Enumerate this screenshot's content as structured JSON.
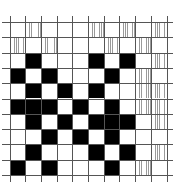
{
  "diagram": {
    "title": "",
    "type": "weave-draft-grid",
    "rows": 10,
    "cols": 10,
    "legend": {
      "B": "black filled cell",
      "H": "vertical-hatched cell",
      "W": "empty white cell"
    },
    "colors": {
      "filled": "#000000",
      "hatch": "#9a9a9a",
      "background": "#ffffff",
      "grid": "#555555"
    },
    "grid": [
      [
        "W",
        "H",
        "W",
        "W",
        "W",
        "H",
        "W",
        "H",
        "W",
        "H"
      ],
      [
        "H",
        "W",
        "H",
        "W",
        "W",
        "W",
        "H",
        "W",
        "H",
        "W"
      ],
      [
        "W",
        "B",
        "W",
        "W",
        "W",
        "B",
        "W",
        "B",
        "W",
        "H"
      ],
      [
        "B",
        "W",
        "B",
        "W",
        "W",
        "W",
        "B",
        "W",
        "H",
        "W"
      ],
      [
        "W",
        "B",
        "W",
        "B",
        "W",
        "B",
        "W",
        "W",
        "H",
        "H"
      ],
      [
        "B",
        "B",
        "B",
        "W",
        "B",
        "W",
        "B",
        "W",
        "H",
        "H"
      ],
      [
        "W",
        "B",
        "W",
        "B",
        "W",
        "B",
        "B",
        "B",
        "W",
        "H"
      ],
      [
        "W",
        "W",
        "B",
        "W",
        "B",
        "W",
        "B",
        "W",
        "W",
        "W"
      ],
      [
        "W",
        "B",
        "W",
        "W",
        "W",
        "B",
        "W",
        "B",
        "W",
        "H"
      ],
      [
        "B",
        "W",
        "B",
        "W",
        "W",
        "W",
        "B",
        "W",
        "H",
        "W"
      ]
    ]
  }
}
